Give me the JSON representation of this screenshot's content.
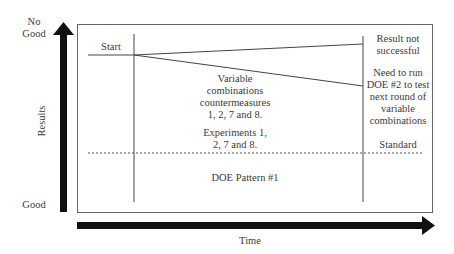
{
  "y_axis": {
    "label": "Results",
    "top_label_line1": "No",
    "top_label_line2": "Good",
    "bottom_label": "Good"
  },
  "x_axis": {
    "label": "Time"
  },
  "annotations": {
    "start": "Start",
    "middle_line1": "Variable",
    "middle_line2": "combinations",
    "middle_line3": "countermeasures",
    "middle_line4": "1, 2, 7 and 8.",
    "experiments_line1": "Experiments 1,",
    "experiments_line2": "2, 7 and 8.",
    "result_line1": "Result not",
    "result_line2": "successful",
    "need_line1": "Need to run",
    "need_line2": "DOE #2 to test",
    "need_line3": "next round of",
    "need_line4": "variable",
    "need_line5": "combinations",
    "standard": "Standard",
    "pattern": "DOE Pattern #1"
  },
  "colors": {
    "axis_arrow": "#111111",
    "frame": "#555555",
    "lines": "#444444"
  }
}
